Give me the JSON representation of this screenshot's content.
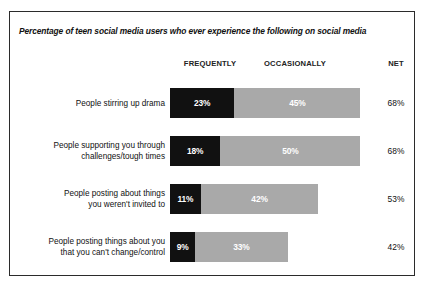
{
  "chart_data": {
    "type": "bar",
    "subtype": "stacked-horizontal",
    "title": "Percentage of teen social media users who ever experience the following on social media",
    "xlabel": "",
    "ylabel": "",
    "grid": false,
    "legend_position": "top-as-column-headers",
    "column_headers": {
      "frequently": "FREQUENTLY",
      "occasionally": "OCCASIONALLY",
      "net": "NET"
    },
    "categories": [
      "People stirring up drama",
      "People supporting you through challenges/tough times",
      "People posting about things you weren't invited to",
      "People posting things about you that you can't change/control"
    ],
    "category_lines": [
      [
        "People stirring up drama"
      ],
      [
        "People supporting you through",
        "challenges/tough times"
      ],
      [
        "People posting about things",
        "you weren't invited to"
      ],
      [
        "People posting things about you",
        "that you can't change/control"
      ]
    ],
    "series": [
      {
        "name": "FREQUENTLY",
        "color": "#111111",
        "values": [
          23,
          18,
          11,
          9
        ],
        "labels": [
          "23%",
          "18%",
          "11%",
          "9%"
        ]
      },
      {
        "name": "OCCASIONALLY",
        "color": "#a9a9a9",
        "values": [
          45,
          50,
          42,
          33
        ],
        "labels": [
          "45%",
          "50%",
          "42%",
          "33%"
        ]
      }
    ],
    "net": {
      "name": "NET",
      "values": [
        68,
        68,
        53,
        42
      ],
      "labels": [
        "68%",
        "68%",
        "53%",
        "42%"
      ]
    },
    "xlim": [
      0,
      68
    ],
    "value_unit": "%"
  },
  "colors": {
    "frequently": "#111111",
    "occasionally": "#a9a9a9",
    "border": "#2b2b2b",
    "background": "#ffffff",
    "text": "#111111",
    "bar_label_text": "#ffffff"
  }
}
